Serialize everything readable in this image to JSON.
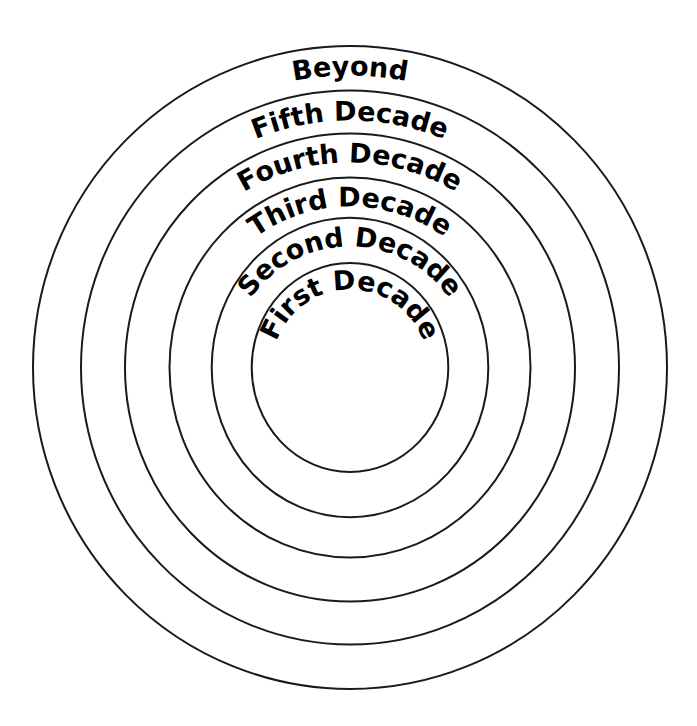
{
  "figure": {
    "title": "",
    "background_color": "#ffffff",
    "stroke_color": "#1a1a1a",
    "text_color": "#000000",
    "width": 697,
    "height": 726
  },
  "chart_data": {
    "type": "pie",
    "subtype": "concentric-rings",
    "title": "",
    "subtitle": "",
    "xlabel": "",
    "ylabel": "",
    "grid": false,
    "legend_position": "none",
    "center": {
      "x": 350,
      "y": 367.5
    },
    "categories": [
      "First Decade",
      "Second Decade",
      "Third Decade",
      "Fourth Decade",
      "Fifth Decade",
      "Beyond"
    ],
    "values": [
      1,
      2,
      3,
      4,
      5,
      6
    ],
    "rings": [
      {
        "index": 1,
        "label": "Beyond",
        "rx": 317,
        "ry": 321.5,
        "label_font_size": 27,
        "label_arc_radius": 292,
        "label_sweep_deg": 23,
        "stroke_width": 2
      },
      {
        "index": 2,
        "label": "Fifth Decade",
        "rx": 269,
        "ry": 277,
        "label_font_size": 27,
        "label_arc_radius": 247,
        "label_sweep_deg": 53,
        "stroke_width": 2
      },
      {
        "index": 3,
        "label": "Fourth Decade",
        "rx": 225,
        "ry": 234,
        "label_font_size": 27,
        "label_arc_radius": 205,
        "label_sweep_deg": 70,
        "stroke_width": 2
      },
      {
        "index": 4,
        "label": "Third Decade",
        "rx": 180.5,
        "ry": 190,
        "label_font_size": 27,
        "label_arc_radius": 161,
        "label_sweep_deg": 82,
        "stroke_width": 2
      },
      {
        "index": 5,
        "label": "Second Decade",
        "rx": 138.3,
        "ry": 149.7,
        "label_font_size": 27,
        "label_arc_radius": 121,
        "label_sweep_deg": 113,
        "stroke_width": 2
      },
      {
        "index": 6,
        "label": "First Decade",
        "rx": 98.3,
        "ry": 104.5,
        "label_font_size": 27,
        "label_arc_radius": 78,
        "label_sweep_deg": 133,
        "stroke_width": 2
      }
    ]
  }
}
